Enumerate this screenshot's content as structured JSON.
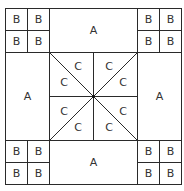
{
  "diagram": {
    "type": "quilt-block-pattern",
    "labels": {
      "corner_square": "B",
      "side_rectangle": "A",
      "center_triangle": "C"
    },
    "corners": [
      {
        "position": "top-left",
        "cells": [
          "B",
          "B",
          "B",
          "B"
        ]
      },
      {
        "position": "top-right",
        "cells": [
          "B",
          "B",
          "B",
          "B"
        ]
      },
      {
        "position": "bottom-left",
        "cells": [
          "B",
          "B",
          "B",
          "B"
        ]
      },
      {
        "position": "bottom-right",
        "cells": [
          "B",
          "B",
          "B",
          "B"
        ]
      }
    ],
    "sides": [
      {
        "position": "top",
        "label": "A"
      },
      {
        "position": "left",
        "label": "A"
      },
      {
        "position": "right",
        "label": "A"
      },
      {
        "position": "bottom",
        "label": "A"
      }
    ],
    "center": {
      "triangles": [
        "C",
        "C",
        "C",
        "C",
        "C",
        "C",
        "C",
        "C"
      ]
    },
    "colors": {
      "line": "#2a2a2a",
      "text": "#333333",
      "background": "#ffffff"
    }
  }
}
